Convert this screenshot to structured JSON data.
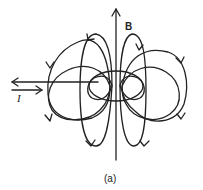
{
  "diagram": {
    "labels": {
      "field": "B",
      "current": "I",
      "caption": "(a)"
    },
    "colors": {
      "line": "#222222",
      "background": "#ffffff"
    },
    "elements": [
      {
        "type": "axis-arrow",
        "label": "B",
        "direction": "up"
      },
      {
        "type": "current-loop",
        "shape": "ellipse"
      },
      {
        "type": "current-leads",
        "label": "I",
        "arrows": [
          "left",
          "right"
        ]
      },
      {
        "type": "field-line-loops",
        "count_per_side": 3,
        "sides": [
          "left",
          "right"
        ]
      }
    ]
  }
}
